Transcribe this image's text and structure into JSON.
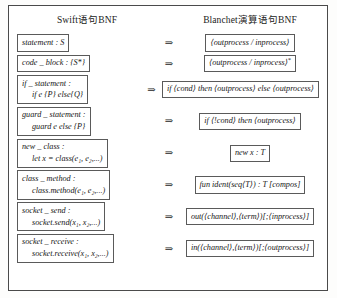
{
  "figure": {
    "headers": {
      "left": "Swift语句BNF",
      "right": "Blanchet演算语句BNF"
    },
    "arrow": "⇒",
    "rows": [
      {
        "name": "statement",
        "left_line1": "statement : S",
        "left_line2": "",
        "right": "⟨outprocess / inprocess⟩",
        "right_suffix": ""
      },
      {
        "name": "code-block",
        "left_line1": "code _ block : {S*}",
        "left_line2": "",
        "right": "⟨outprocess / inprocess⟩",
        "right_suffix": "*"
      },
      {
        "name": "if-statement",
        "left_line1": "if _ statement :",
        "left_line2": "if e {P} else{Q}",
        "right": "if ⟨cond⟩ then ⟨outprocess⟩ else ⟨outprocess⟩",
        "right_suffix": ""
      },
      {
        "name": "guard-statement",
        "left_line1": "guard _ statement :",
        "left_line2": "guard e else {P}",
        "right": "if ⟨!cond⟩ then ⟨outprocess⟩",
        "right_suffix": ""
      },
      {
        "name": "new-class",
        "left_line1": "new _ class :",
        "left_line2": "let x = class(e₁, e₂,...)",
        "right": "new x : T",
        "right_suffix": ""
      },
      {
        "name": "class-method",
        "left_line1": "class _ method :",
        "left_line2": "class.method(e₁, e₂,...)",
        "right": "fun ident(seq⟨T⟩) : T [compos]",
        "right_suffix": ""
      },
      {
        "name": "socket-send",
        "left_line1": "socket _ send :",
        "left_line2": "socket.send(x₁, x₂,...)",
        "right": "out(⟨channel⟩,⟨term⟩)[;⟨inprocess⟩]",
        "right_suffix": ""
      },
      {
        "name": "socket-receive",
        "left_line1": "socket _ receive :",
        "left_line2": "socket.receive(x₁, x₂,...)",
        "right": "in(⟨channel⟩,⟨term⟩)[;⟨outprocess⟩]",
        "right_suffix": ""
      }
    ]
  }
}
